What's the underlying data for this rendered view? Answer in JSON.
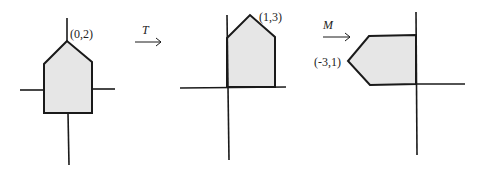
{
  "colors": {
    "stroke": "#1a1a1a",
    "fill": "#e6e6e6",
    "background": "#ffffff"
  },
  "panels": [
    {
      "name": "original",
      "label": "(0,2)"
    },
    {
      "name": "translated",
      "label": "(1,3)"
    },
    {
      "name": "rotated",
      "label": "(-3,1)"
    }
  ],
  "arrows": [
    {
      "label": "T"
    },
    {
      "label": "M"
    }
  ]
}
